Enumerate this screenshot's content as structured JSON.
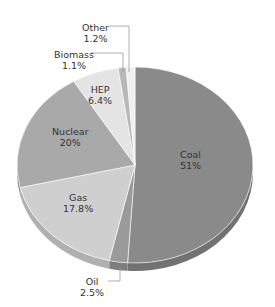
{
  "chart_data": {
    "type": "pie",
    "title": "",
    "slices": [
      {
        "label": "Coal",
        "value": 51,
        "display": "51%",
        "color": "#8a8a8a",
        "edge": "#727272"
      },
      {
        "label": "Oil",
        "value": 2.5,
        "display": "2.5%",
        "color": "#9a9a9a",
        "edge": "#7d7d7d"
      },
      {
        "label": "Gas",
        "value": 17.8,
        "display": "17.8%",
        "color": "#cfcfcf",
        "edge": "#b0b0b0"
      },
      {
        "label": "Nuclear",
        "value": 20,
        "display": "20%",
        "color": "#a9a9a9",
        "edge": "#929292"
      },
      {
        "label": "HEP",
        "value": 6.4,
        "display": "6.4%",
        "color": "#e4e4e4",
        "edge": "#c8c8c8"
      },
      {
        "label": "Biomass",
        "value": 1.1,
        "display": "1.1%",
        "color": "#b8b8b8",
        "edge": "#9e9e9e"
      },
      {
        "label": "Other",
        "value": 1.2,
        "display": "1.2%",
        "color": "#f0f0f0",
        "edge": "#d6d6d6"
      }
    ],
    "start_angle": "12 o'clock",
    "direction": "clockwise",
    "legend": "none (inline labels with leader lines for Oil, Biomass, Other)"
  },
  "labels": {
    "coal": {
      "name": "Coal",
      "pct": "51%"
    },
    "oil": {
      "name": "Oil",
      "pct": "2.5%"
    },
    "gas": {
      "name": "Gas",
      "pct": "17.8%"
    },
    "nuclear": {
      "name": "Nuclear",
      "pct": "20%"
    },
    "hep": {
      "name": "HEP",
      "pct": "6.4%"
    },
    "biomass": {
      "name": "Biomass",
      "pct": "1.1%"
    },
    "other": {
      "name": "Other",
      "pct": "1.2%"
    }
  }
}
